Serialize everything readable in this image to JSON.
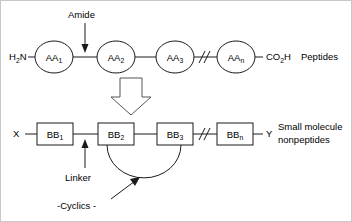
{
  "diagram": {
    "colors": {
      "stroke": "#1a1a1a",
      "background": "#ffffff",
      "block_arrow_stroke": "#555555",
      "border": "#c8c8c8"
    },
    "top_row": {
      "caption": "Peptides",
      "n_terminus": "H",
      "n_terminus_sub": "2",
      "n_terminus_tail": "N",
      "c_terminus": "CO",
      "c_terminus_sub": "2",
      "c_terminus_tail": "H",
      "break_symbol": "//",
      "nodes": [
        {
          "label": "AA",
          "sub": "1"
        },
        {
          "label": "AA",
          "sub": "2"
        },
        {
          "label": "AA",
          "sub": "3"
        },
        {
          "label": "AA",
          "sub": "n"
        }
      ],
      "annotation": "Amide"
    },
    "transition": {
      "arrow_name": "down-block-arrow"
    },
    "bottom_row": {
      "caption_line1": "Small molecule",
      "caption_line2": "nonpeptides",
      "left_terminus": "X",
      "right_terminus": "Y",
      "break_symbol": "//",
      "nodes": [
        {
          "label": "BB",
          "sub": "1"
        },
        {
          "label": "BB",
          "sub": "2"
        },
        {
          "label": "BB",
          "sub": "3"
        },
        {
          "label": "BB",
          "sub": "n"
        }
      ],
      "annotations": {
        "linker": "Linker",
        "cyclics": "-Cyclics -"
      }
    }
  }
}
